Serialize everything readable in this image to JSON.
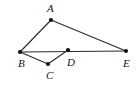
{
  "figure": {
    "type": "geometry-diagram",
    "width": 137,
    "height": 89,
    "background_color": "#ffffff",
    "stroke_color": "#2b2b2b",
    "point_color": "#111111",
    "label_color": "#141414"
  },
  "points": [
    {
      "name": "A",
      "label": "A",
      "x": 51,
      "y": 20,
      "label_x": 47,
      "label_y": 3
    },
    {
      "name": "B",
      "label": "B",
      "x": 20,
      "y": 52,
      "label_x": 18,
      "label_y": 58
    },
    {
      "name": "C",
      "label": "C",
      "x": 48,
      "y": 64,
      "label_x": 46,
      "label_y": 70
    },
    {
      "name": "D",
      "label": "D",
      "x": 68,
      "y": 50,
      "label_x": 67,
      "label_y": 57
    },
    {
      "name": "E",
      "label": "E",
      "x": 126,
      "y": 51,
      "label_x": 123,
      "label_y": 58
    }
  ],
  "segments": [
    {
      "name": "segment-AB",
      "from": "B",
      "to": "A"
    },
    {
      "name": "segment-AE",
      "from": "A",
      "to": "E"
    },
    {
      "name": "segment-BE",
      "from": "B",
      "to": "E"
    },
    {
      "name": "segment-BC",
      "from": "B",
      "to": "C"
    },
    {
      "name": "segment-CD",
      "from": "C",
      "to": "D"
    }
  ],
  "labels": {
    "A": "A",
    "B": "B",
    "C": "C",
    "D": "D",
    "E": "E"
  }
}
